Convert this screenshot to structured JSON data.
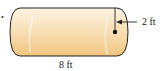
{
  "figure": {
    "type": "cylinder",
    "bullet": "•",
    "labels": {
      "radius": "2 ft",
      "length": "8 ft"
    },
    "colors": {
      "fill_light": "#fdf1dc",
      "fill_dark": "#f2c98c",
      "outline": "#222222",
      "highlight": "#ffffff"
    }
  }
}
